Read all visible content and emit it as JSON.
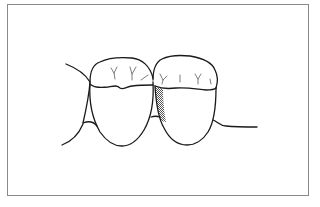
{
  "figure": {
    "frame_color": "#8a8a8a",
    "line_color": "#1a1a1a",
    "hatch_color": "#555555"
  },
  "paths": {
    "left_gum_upper": "M66,64 C76,68 86,75 90,82",
    "left_interdental": "M90,82 C89,96 86,110 83,123",
    "left_gum_lower": "M83,124 C78,136 70,142 62,145",
    "left_papilla": "M83,123 C88,121 93,121 97,126",
    "left_tooth_crown_top": "M90,82 C90,70 94,64 100,62 C110,57 120,57 132,58 C142,59 150,66 153,78",
    "left_tooth_cej": "M90,84 C94,88 100,88 108,87 C114,86 117,85 120,88 C123,90 126,87 132,86 C140,85 148,85 153,85",
    "left_tooth_body": "M90,84 C89,100 92,118 100,132 C107,142 115,146 122,146 C130,146 138,140 144,130 C151,118 154,100 153,82",
    "mid_papilla": "M151,117 C154,116 157,116 160,117",
    "right_tooth_crown_top": "M153,80 C153,70 156,62 162,59 C170,55 180,55 190,56 C202,58 212,62 215,70 C218,76 218,82 216,88",
    "right_tooth_cej": "M155,86 C162,89 168,89 176,88 C186,87 196,89 206,90 C210,90 214,90 216,88",
    "right_tooth_body": "M155,86 C156,102 158,118 164,128 C170,140 178,145 187,145 C195,145 203,140 208,132 C213,124 216,108 216,88",
    "right_gingiva": "M213,120 C218,122 220,126 226,126 C236,127 248,127 257,127",
    "hatched_area": "M155,87 L163,89 C163,100 164,112 166,122 L161,121 C158,112 156,99 155,87 Z"
  },
  "fissures": {
    "left": [
      "M111,68 L114,73 M117,67 L114,73 L115,79",
      "M130,67 L132,74 M136,67 L132,74 L132,80",
      "M141,80 L148,75"
    ],
    "right": [
      "M160,74 L163,80 M167,76 L163,80 L162,84",
      "M180,75 L180,82",
      "M195,74 L198,79 M201,74 L198,79 L198,84",
      "M210,79 L211,84"
    ]
  }
}
